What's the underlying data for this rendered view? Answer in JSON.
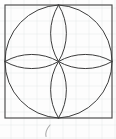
{
  "figure": {
    "background_color": "#fdfdfd",
    "ink_color": "#3c3c3c",
    "outline_color": "#4a4a4a",
    "grid_color": "#d9dde3",
    "pencil_color": "#9a9a9a",
    "square": {
      "name": "bounding-square",
      "x": 5,
      "y": 5,
      "width": 107,
      "height": 113,
      "stroke_width": 1.15
    },
    "center_point": {
      "name": "rosette-center",
      "x": 58.5,
      "y": 61.5
    },
    "side_midpoints": [
      {
        "name": "top-midpoint",
        "x": 58.5,
        "y": 5
      },
      {
        "name": "right-midpoint",
        "x": 112,
        "y": 61.5
      },
      {
        "name": "bottom-midpoint",
        "x": 58.5,
        "y": 118
      },
      {
        "name": "left-midpoint",
        "x": 5,
        "y": 61.5
      }
    ],
    "arcs": [
      {
        "name": "arc-top-left-quadrant",
        "from": "top-midpoint",
        "to": "left-midpoint",
        "sweep": "through top-left corner region",
        "path": "M 58.5 5 A 53.5 56.5 0 0 0 5 61.5"
      },
      {
        "name": "arc-top-right-quadrant",
        "from": "top-midpoint",
        "to": "right-midpoint",
        "sweep": "through top-right corner region",
        "path": "M 58.5 5 A 53.5 56.5 0 0 1 112 61.5"
      },
      {
        "name": "arc-bottom-right-quadrant",
        "from": "right-midpoint",
        "to": "bottom-midpoint",
        "sweep": "through bottom-right corner region",
        "path": "M 112 61.5 A 53.5 56.5 0 0 1 58.5 118"
      },
      {
        "name": "arc-bottom-left-quadrant",
        "from": "bottom-midpoint",
        "to": "left-midpoint",
        "sweep": "through bottom-left corner region",
        "path": "M 58.5 118 A 53.5 56.5 0 0 1 5 61.5"
      },
      {
        "name": "arc-center-top-left",
        "from": "top-midpoint",
        "to": "center",
        "path": "M 58.5 5 A 53.5 56.5 0 0 1 5 61.5",
        "note": "inner half-circle arc sweeping to center"
      }
    ],
    "petals": [
      {
        "name": "petal-top",
        "orientation": "up"
      },
      {
        "name": "petal-right",
        "orientation": "right"
      },
      {
        "name": "petal-bottom",
        "orientation": "down"
      },
      {
        "name": "petal-left",
        "orientation": "left"
      }
    ],
    "grid": {
      "name": "graph-paper-grid",
      "visible": true,
      "spacing": 13,
      "x_positions": [
        11,
        24,
        37,
        50,
        63,
        76,
        89,
        102,
        115
      ],
      "y_positions": [
        8,
        21,
        34,
        47,
        60,
        73,
        86,
        99,
        112,
        125,
        138
      ]
    },
    "annotation": {
      "name": "pencil-mark",
      "visible": true,
      "x": 45,
      "y": 125,
      "width": 9,
      "height": 12,
      "description": "faint handwritten pencil stroke below the square"
    }
  }
}
